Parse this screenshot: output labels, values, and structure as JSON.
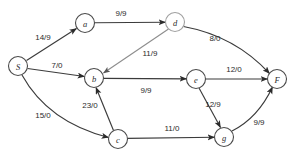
{
  "diagram": {
    "type": "directed-graph",
    "width": 292,
    "height": 159,
    "colors": {
      "background": "#ffffff",
      "edge": "#3b3b3b",
      "edge_faint": "#8d8d8d",
      "node_stroke": "#4a4a4a",
      "text": "#2b2b2b"
    },
    "nodes": [
      {
        "id": "S",
        "label": "S",
        "x": 18,
        "y": 66,
        "r": 9.5,
        "faint": false
      },
      {
        "id": "a",
        "label": "a",
        "x": 85,
        "y": 23,
        "r": 9.5,
        "faint": false
      },
      {
        "id": "d",
        "label": "d",
        "x": 175,
        "y": 22,
        "r": 9.5,
        "faint": true
      },
      {
        "id": "b",
        "label": "b",
        "x": 94,
        "y": 78,
        "r": 9.5,
        "faint": false
      },
      {
        "id": "e",
        "label": "e",
        "x": 196,
        "y": 79,
        "r": 9.5,
        "faint": false
      },
      {
        "id": "F",
        "label": "F",
        "x": 277,
        "y": 79,
        "r": 9.5,
        "faint": false
      },
      {
        "id": "c",
        "label": "c",
        "x": 118,
        "y": 139,
        "r": 9.5,
        "faint": false
      },
      {
        "id": "g",
        "label": "g",
        "x": 224,
        "y": 137,
        "r": 9.5,
        "faint": false
      }
    ],
    "edges": [
      {
        "id": "S-a",
        "from": "S",
        "to": "a",
        "label": "14/9",
        "label_x": 43,
        "label_y": 37,
        "path": "M 26.5 60.5 L 76.5 28.5",
        "faint": false
      },
      {
        "id": "a-d",
        "from": "a",
        "to": "d",
        "label": "9/9",
        "label_x": 121,
        "label_y": 13,
        "path": "M 94.5 22.8 L 165.5 22.2",
        "faint": false
      },
      {
        "id": "d-F",
        "from": "d",
        "to": "F",
        "label": "8/0",
        "label_x": 215,
        "label_y": 38,
        "path": "M 183.5 26.5 Q 235 36 269.5 73.5",
        "faint": false
      },
      {
        "id": "d-b",
        "from": "d",
        "to": "b",
        "label": "11/9",
        "label_x": 150,
        "label_y": 53,
        "path": "M 168.5 29 L 103.5 73",
        "faint": true
      },
      {
        "id": "S-b",
        "from": "S",
        "to": "b",
        "label": "7/0",
        "label_x": 57,
        "label_y": 65,
        "path": "M 27.5 68.5 L 84.5 76.5",
        "faint": false
      },
      {
        "id": "b-e",
        "from": "b",
        "to": "e",
        "label": "9/9",
        "label_x": 146,
        "label_y": 90,
        "path": "M 103.5 78.4 L 186.5 78.8",
        "faint": false
      },
      {
        "id": "e-F",
        "from": "e",
        "to": "F",
        "label": "12/0",
        "label_x": 234,
        "label_y": 69,
        "path": "M 205.5 79 L 267.5 79",
        "faint": false
      },
      {
        "id": "S-c",
        "from": "S",
        "to": "c",
        "label": "15/0",
        "label_x": 43,
        "label_y": 115,
        "path": "M 22 75 Q 48 122 108.5 137.5",
        "faint": false
      },
      {
        "id": "c-b",
        "from": "c",
        "to": "b",
        "label": "23/0",
        "label_x": 90,
        "label_y": 105,
        "path": "M 113.5 130.5 L 96 87.5",
        "faint": false
      },
      {
        "id": "c-g",
        "from": "c",
        "to": "g",
        "label": "11/0",
        "label_x": 172,
        "label_y": 128,
        "path": "M 127.5 138.4 L 214.5 137.3",
        "faint": false
      },
      {
        "id": "e-g",
        "from": "e",
        "to": "g",
        "label": "12/9",
        "label_x": 213,
        "label_y": 104,
        "path": "M 199 88 L 220.5 127.5",
        "faint": false
      },
      {
        "id": "g-F",
        "from": "g",
        "to": "F",
        "label": "9/9",
        "label_x": 259,
        "label_y": 122,
        "path": "M 232 131 Q 258 118 272.5 87",
        "faint": false
      }
    ]
  }
}
